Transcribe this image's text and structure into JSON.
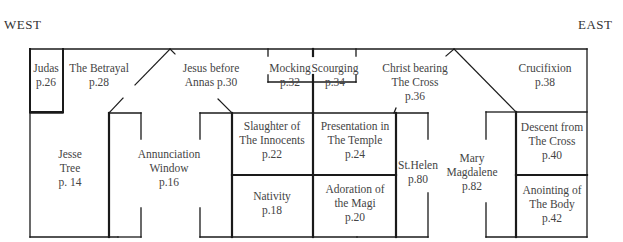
{
  "directions": {
    "west": "WEST",
    "east": "EAST"
  },
  "panels": [
    {
      "id": "judas",
      "lines": [
        "Judas",
        "p.26"
      ],
      "x": 46,
      "y": 61
    },
    {
      "id": "betrayal",
      "lines": [
        "The Betrayal",
        "p.28"
      ],
      "x": 99,
      "y": 61
    },
    {
      "id": "annas",
      "lines": [
        "Jesus before",
        "Annas p.30"
      ],
      "x": 211,
      "y": 61
    },
    {
      "id": "mocking",
      "lines": [
        "Mocking",
        "p.32"
      ],
      "x": 290,
      "y": 61
    },
    {
      "id": "scourging",
      "lines": [
        "Scourging",
        "p.34"
      ],
      "x": 335,
      "y": 61
    },
    {
      "id": "bearing-cross",
      "lines": [
        "Christ bearing",
        "The Cross",
        "p.36"
      ],
      "x": 415,
      "y": 61
    },
    {
      "id": "crucifixion",
      "lines": [
        "Crucifixion",
        "p.38"
      ],
      "x": 545,
      "y": 61
    },
    {
      "id": "jesse-tree",
      "lines": [
        "Jesse",
        "Tree",
        "p. 14"
      ],
      "x": 70,
      "y": 147
    },
    {
      "id": "annunciation",
      "lines": [
        "Annunciation",
        "Window",
        "p.16"
      ],
      "x": 169,
      "y": 147
    },
    {
      "id": "innocents",
      "lines": [
        "Slaughter of",
        "The Innocents",
        "p.22"
      ],
      "x": 272,
      "y": 119
    },
    {
      "id": "presentation",
      "lines": [
        "Presentation in",
        "The Temple",
        "p.24"
      ],
      "x": 355,
      "y": 119
    },
    {
      "id": "nativity",
      "lines": [
        "Nativity",
        "p.18"
      ],
      "x": 272,
      "y": 189
    },
    {
      "id": "magi",
      "lines": [
        "Adoration of",
        "the Magi",
        "p.20"
      ],
      "x": 355,
      "y": 182
    },
    {
      "id": "st-helen",
      "lines": [
        "St.Helen",
        "p.80"
      ],
      "x": 418,
      "y": 158
    },
    {
      "id": "magdalene",
      "lines": [
        "Mary",
        "Magdalene",
        "p.82"
      ],
      "x": 472,
      "y": 151
    },
    {
      "id": "descent",
      "lines": [
        "Descent from",
        "The Cross",
        "p.40"
      ],
      "x": 552,
      "y": 120
    },
    {
      "id": "anointing",
      "lines": [
        "Anointing of",
        "The Body",
        "p.42"
      ],
      "x": 552,
      "y": 183
    }
  ],
  "colors": {
    "line": "#1a1a1a",
    "text": "#444444"
  }
}
